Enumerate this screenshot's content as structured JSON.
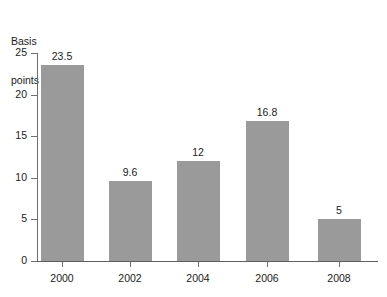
{
  "chart_data": {
    "type": "bar",
    "title": "",
    "xlabel": "",
    "ylabel": "Basis points",
    "ylabel_lines": [
      "Basis",
      "points"
    ],
    "categories": [
      "2000",
      "2002",
      "2004",
      "2006",
      "2008"
    ],
    "values": [
      23.5,
      9.6,
      12,
      16.8,
      5
    ],
    "value_labels": [
      "23.5",
      "9.6",
      "12",
      "16.8",
      "5"
    ],
    "series": [
      {
        "name": "Basis points",
        "values": [
          23.5,
          9.6,
          12,
          16.8,
          5
        ]
      }
    ],
    "ylim": [
      0,
      25
    ],
    "y_ticks": [
      0,
      5,
      10,
      15,
      20,
      25
    ],
    "y_tick_labels": [
      "0",
      "5",
      "10",
      "15",
      "20",
      "25"
    ],
    "grid": false,
    "legend": false,
    "legend_position": "none",
    "bar_color": "#9a9a9a",
    "axis_color": "#6e6e6e",
    "text_color": "#1b1b1b",
    "background": "#ffffff"
  }
}
